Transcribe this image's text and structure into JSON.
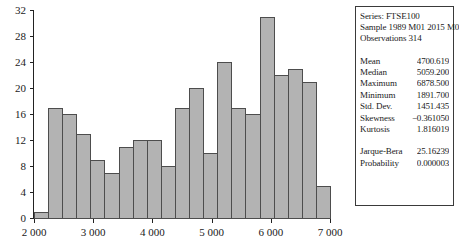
{
  "chart_data": {
    "type": "bar",
    "title": "",
    "xlabel": "",
    "ylabel": "",
    "xlim": [
      2000,
      7000
    ],
    "ylim": [
      0,
      32
    ],
    "grid": false,
    "legend": "none",
    "bin_width": 238,
    "x_ticks": [
      "2 000",
      "3 000",
      "4 000",
      "5 000",
      "6 000",
      "7 000"
    ],
    "x_tick_values": [
      2000,
      3000,
      4000,
      5000,
      6000,
      7000
    ],
    "y_ticks": [
      "0",
      "4",
      "8",
      "12",
      "16",
      "20",
      "24",
      "28",
      "32"
    ],
    "y_tick_values": [
      0,
      4,
      8,
      12,
      16,
      20,
      24,
      28,
      32
    ],
    "categories": [
      "2000-2238",
      "2238-2476",
      "2476-2714",
      "2714-2952",
      "2952-3190",
      "3190-3429",
      "3429-3667",
      "3667-3905",
      "3905-4143",
      "4143-4381",
      "4381-4619",
      "4619-4857",
      "4857-5095",
      "5095-5333",
      "5333-5571",
      "5571-5810",
      "5810-6048",
      "6048-6286",
      "6286-6524",
      "6524-6762",
      "6762-7000"
    ],
    "values": [
      1,
      17,
      16,
      13,
      9,
      7,
      11,
      12,
      12,
      8,
      17,
      20,
      10,
      24,
      17,
      16,
      31,
      22,
      23,
      21,
      5
    ],
    "bar_color": "#b3b3b3",
    "bar_edge_color": "#4d4d4d"
  },
  "stats_panel": {
    "series_line": "Series: FTSE100",
    "sample_line": "Sample 1989 M01 2015 M02",
    "observations_line": "Observations 314",
    "rows": [
      {
        "label": "Mean",
        "value": "4700.619"
      },
      {
        "label": "Median",
        "value": "5059.200"
      },
      {
        "label": "Maximum",
        "value": "6878.500"
      },
      {
        "label": "Minimum",
        "value": "1891.700"
      },
      {
        "label": "Std. Dev.",
        "value": "1451.435"
      },
      {
        "label": "Skewness",
        "value": "−0.361050"
      },
      {
        "label": "Kurtosis",
        "value": "1.816019"
      }
    ],
    "test_rows": [
      {
        "label": "Jarque-Bera",
        "value": "25.16239"
      },
      {
        "label": "Probability",
        "value": "0.000003"
      }
    ]
  }
}
